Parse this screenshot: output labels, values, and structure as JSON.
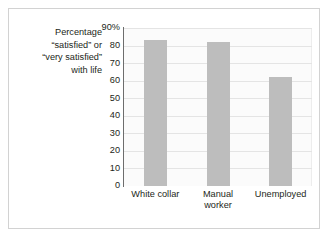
{
  "chart_data": {
    "type": "bar",
    "title": "",
    "subtitle": "",
    "xlabel": "",
    "ylabel": "Percentage “satisfied” or “very satisfied” with life",
    "ylabel_lines": [
      "Percentage",
      "“satisfied” or",
      "“very satisfied”",
      "with life"
    ],
    "categories": [
      "White collar",
      "Manual worker",
      "Unemployed"
    ],
    "category_lines": [
      [
        "White collar"
      ],
      [
        "Manual",
        "worker"
      ],
      [
        "Unemployed"
      ]
    ],
    "values": [
      83,
      82,
      62
    ],
    "ylim": [
      0,
      90
    ],
    "yticks": [
      0,
      10,
      20,
      30,
      40,
      50,
      60,
      70,
      80,
      90
    ],
    "ytick_labels": [
      "0",
      "10",
      "20",
      "30",
      "40",
      "50",
      "60",
      "70",
      "80",
      "90%"
    ],
    "grid": true,
    "legend": false,
    "legend_position": "none",
    "bar_color": "#bdbdbd",
    "gridline_color": "#e4e4e4",
    "axis_color": "#6d6d6d",
    "text_color": "#231f20",
    "frame_color": "#d2d2d2",
    "plot_background": "#fbfbfb",
    "figure_background": "#ffffff"
  }
}
